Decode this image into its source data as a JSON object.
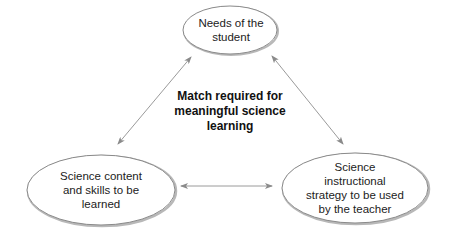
{
  "diagram": {
    "nodes": [
      {
        "id": "student",
        "label": "Needs of the\nstudent"
      },
      {
        "id": "content",
        "label": "Science content\nand skills to be\nlearned"
      },
      {
        "id": "strategy",
        "label": "Science\ninstructional\nstrategy to be used\nby the teacher"
      }
    ],
    "center_label": "Match required for\nmeaningful science\nlearning",
    "edges": [
      {
        "from": "student",
        "to": "content",
        "type": "bidirectional"
      },
      {
        "from": "student",
        "to": "strategy",
        "type": "bidirectional"
      },
      {
        "from": "content",
        "to": "strategy",
        "type": "bidirectional"
      }
    ],
    "colors": {
      "ellipse_stroke": "#8a8a8a",
      "ellipse_shadow": "#b0b0b0",
      "arrow": "#9a9a9a",
      "text": "#222222"
    }
  }
}
